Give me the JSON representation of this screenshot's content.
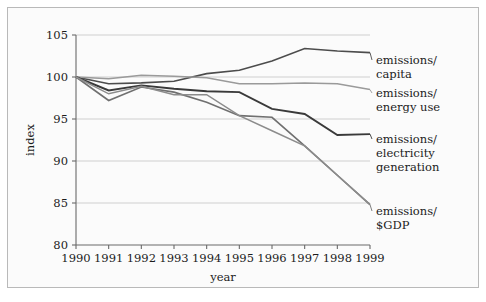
{
  "chart_data": {
    "type": "line",
    "title": "",
    "xlabel": "year",
    "ylabel": "index",
    "x": [
      1990,
      1991,
      1992,
      1993,
      1994,
      1995,
      1996,
      1997,
      1998,
      1999
    ],
    "xticklabels": [
      "1990",
      "1991",
      "1992",
      "1993",
      "1994",
      "1995",
      "1996",
      "1997",
      "1998",
      "1999"
    ],
    "yticklabels": [
      "80",
      "85",
      "90",
      "95",
      "100",
      "105"
    ],
    "yticks": [
      80,
      85,
      90,
      95,
      100,
      105
    ],
    "ylim": [
      80,
      105
    ],
    "xlim": [
      1990,
      1999
    ],
    "grid": "horizontal",
    "legend_position": "right-inline-labels",
    "series": [
      {
        "name": "emissions/capita",
        "label_lines": [
          "emissions/",
          "capita"
        ],
        "color": "#4c4c4c",
        "width": 1.6,
        "values": [
          100.0,
          99.2,
          99.3,
          99.5,
          100.4,
          100.8,
          101.9,
          103.4,
          103.1,
          102.9
        ]
      },
      {
        "name": "emissions/energy use",
        "label_lines": [
          "emissions/",
          "energy use"
        ],
        "color": "#9a9a9a",
        "width": 1.5,
        "values": [
          100.0,
          99.8,
          100.2,
          100.1,
          99.9,
          99.2,
          99.2,
          99.3,
          99.2,
          98.5
        ]
      },
      {
        "name": "emissions/electricity generation",
        "label_lines": [
          "emissions/",
          "electricity",
          "generation"
        ],
        "color": "#3a3a3a",
        "width": 1.9,
        "values": [
          100.0,
          98.4,
          99.0,
          98.6,
          98.3,
          98.2,
          96.2,
          95.6,
          93.1,
          93.2
        ]
      },
      {
        "name": "emissions/$GDP",
        "label_lines": [
          "emissions/",
          "$GDP"
        ],
        "color": "#707070",
        "width": 1.6,
        "values": [
          100.0,
          97.2,
          98.8,
          98.2,
          97.0,
          95.4,
          95.2,
          91.8,
          88.3,
          84.8
        ]
      },
      {
        "name": "unlabeled-series",
        "label_lines": [],
        "color": "#8c8c8c",
        "width": 1.5,
        "values": [
          100.0,
          98.0,
          98.9,
          97.9,
          97.9,
          95.4,
          93.6,
          91.8,
          88.3,
          84.8
        ]
      }
    ]
  },
  "legend": {
    "entries": [
      {
        "lines": [
          "emissions/",
          "capita"
        ]
      },
      {
        "lines": [
          "emissions/",
          "energy use"
        ]
      },
      {
        "lines": [
          "emissions/",
          "electricity",
          "generation"
        ]
      },
      {
        "lines": [
          "emissions/",
          "$GDP"
        ]
      }
    ]
  },
  "colors": {
    "page_background": "#ffffff",
    "card_background": "#fbfbfb",
    "card_border": "#b9b9b9",
    "gridline": "#c9c9c9",
    "axis": "#6a6a6a",
    "text": "#1c1c1c"
  }
}
